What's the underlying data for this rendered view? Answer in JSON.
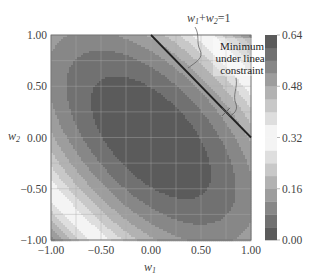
{
  "chart_data": {
    "type": "heatmap",
    "subtype": "filled-contour",
    "title": "",
    "xlabel": "w1",
    "ylabel": "w2",
    "xlim": [
      -1.0,
      1.0
    ],
    "ylim": [
      -1.0,
      1.0
    ],
    "xticks": [
      "-1.00",
      "-0.50",
      "0.00",
      "0.50",
      "1.00"
    ],
    "yticks": [
      "-1.00",
      "-0.50",
      "0.00",
      "0.50",
      "1.00"
    ],
    "grid": true,
    "grid_step": 0.25,
    "function": "quadratic bowl with positive w1-w2 correlation term, minimum near (0, 0), elliptical contours tilted along w1 = -w2",
    "minimum": {
      "w1": 0.0,
      "w2": 0.0,
      "value": 0.0
    },
    "colorbar": {
      "min": 0.0,
      "max": 0.64,
      "ticks": [
        "0.00",
        "0.16",
        "0.32",
        "0.48",
        "0.64"
      ],
      "levels": [
        0.0,
        0.04,
        0.08,
        0.12,
        0.16,
        0.2,
        0.24,
        0.28,
        0.32,
        0.36,
        0.4,
        0.44,
        0.48,
        0.52,
        0.56,
        0.6,
        0.64
      ],
      "colormap": "diverging gray: dark at 0.00 and 0.64, white near 0.32"
    },
    "constraint_line": {
      "equation": "w1+w2=1",
      "from": [
        0.0,
        1.0
      ],
      "to": [
        1.0,
        0.0
      ]
    },
    "annotations": [
      {
        "text": "w1+w2=1",
        "target": "constraint line"
      },
      {
        "text": "Minimum under linear constraint",
        "point": [
          0.75,
          0.25
        ]
      }
    ]
  },
  "labels": {
    "xlabel": "w",
    "xlabel_sub": "1",
    "ylabel": "w",
    "ylabel_sub": "2",
    "constraint_w1": "w",
    "constraint_sub1": "1",
    "constraint_plus": "+",
    "constraint_w2": "w",
    "constraint_sub2": "2",
    "constraint_eq": "=1",
    "anno_line1": "Minimum",
    "anno_line2": "under linear",
    "anno_line3": "constraint"
  }
}
